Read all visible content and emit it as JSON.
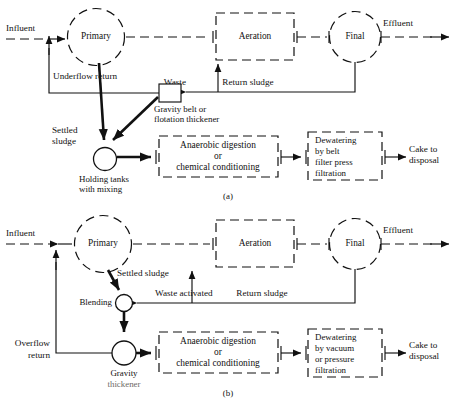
{
  "figure": {
    "panels": [
      {
        "id": "a",
        "caption": "(a)",
        "nodes": {
          "primary": "Primary",
          "aeration": "Aeration",
          "final": "Final",
          "thickener": "Gravity belt or\nflotation thickener",
          "thickener_line1": "Gravity belt or",
          "thickener_line2": "flotation thickener",
          "holding": "Holding tanks\nwith mixing",
          "holding_line1": "Holding tanks",
          "holding_line2": "with mixing",
          "digestion_line1": "Anaerobic digestion",
          "digestion_line2": "or",
          "digestion_line3": "chemical conditioning",
          "dewatering_line1": "Dewatering",
          "dewatering_line2": "by  belt",
          "dewatering_line3": "filter press",
          "dewatering_line4": "filtration"
        },
        "flows": {
          "influent": "Influent",
          "effluent": "Effluent",
          "underflow": "Underflow  return",
          "settled_line1": "Settled",
          "settled_line2": "sludge",
          "waste": "Waste",
          "return_sludge": "Return sludge",
          "cake_line1": "Cake to",
          "cake_line2": "disposal"
        }
      },
      {
        "id": "b",
        "caption": "(b)",
        "nodes": {
          "primary": "Primary",
          "aeration": "Aeration",
          "final": "Final",
          "blending": "Blending",
          "gravity_line1": "Gravity",
          "gravity_line2": "thickener",
          "digestion_line1": "Anaerobic digestion",
          "digestion_line2": "or",
          "digestion_line3": "chemical conditioning",
          "dewatering_line1": "Dewatering",
          "dewatering_line2": "by vacuum",
          "dewatering_line3": "or pressure",
          "dewatering_line4": "filtration"
        },
        "flows": {
          "influent": "Influent",
          "effluent": "Effluent",
          "settled_sludge": "Settled sludge",
          "waste_activated": "Waste activated",
          "return_sludge": "Return sludge",
          "overflow_line1": "Overflow",
          "overflow_line2": "return",
          "cake_line1": "Cake to",
          "cake_line2": "disposal"
        }
      }
    ],
    "colors": {
      "ink": "#111111",
      "paper": "#ffffff",
      "faded_ink": "#6e6a66"
    }
  }
}
